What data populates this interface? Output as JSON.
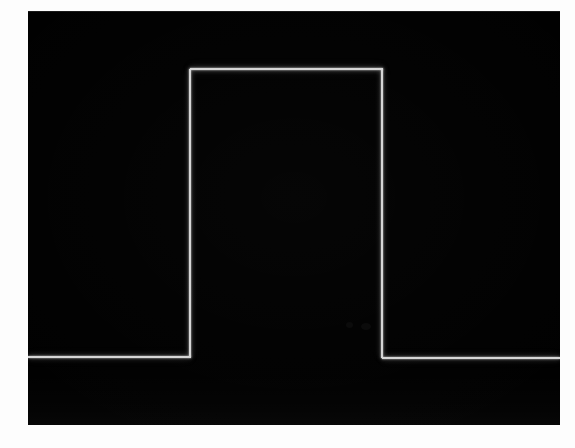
{
  "image": {
    "kind": "oscilloscope-screen-photograph",
    "width_px": 575,
    "height_px": 448,
    "paper_border_color": "#fdfdfd",
    "caption": "Oscilloscope screen showing a single rectangular pulse waveform"
  },
  "screen": {
    "name": "oscilloscope-display",
    "background_color": "#010101",
    "left_px": 28,
    "top_px": 11,
    "width_px": 532,
    "height_px": 414,
    "graticule_visible": false,
    "onscreen_text": "",
    "annotations": []
  },
  "trace": {
    "name": "pulse-trace",
    "color": "#d6d6d6",
    "line_width_px": 2,
    "glow": true,
    "segments": [
      {
        "id": "baseline-left",
        "type": "horizontal",
        "x1": 28,
        "x2": 191,
        "y": 357
      },
      {
        "id": "rising-edge",
        "type": "vertical",
        "x": 190,
        "y1": 357,
        "y2": 69
      },
      {
        "id": "pulse-top",
        "type": "horizontal",
        "x1": 190,
        "x2": 383,
        "y": 69
      },
      {
        "id": "falling-edge",
        "type": "vertical",
        "x": 382,
        "y1": 69,
        "y2": 358
      },
      {
        "id": "baseline-right",
        "type": "horizontal",
        "x1": 382,
        "x2": 560,
        "y": 358
      }
    ]
  },
  "chart_data": {
    "type": "line",
    "title": "Rectangular pulse waveform",
    "subtitle": "",
    "xlabel": "",
    "ylabel": "",
    "legend": [],
    "legend_position": "none",
    "grid": false,
    "xlim": [
      0,
      100
    ],
    "ylim": [
      0,
      100
    ],
    "series": [
      {
        "name": "pulse",
        "color": "#d6d6d6",
        "x": [
          0,
          30.5,
          30.5,
          66.5,
          66.5,
          100
        ],
        "y": [
          0,
          0,
          100,
          100,
          0,
          0
        ]
      }
    ],
    "notes": {
      "baseline_level": 0,
      "high_level": 100,
      "pulse_start_pct": 30.5,
      "pulse_end_pct": 66.5,
      "duty_cycle_pct": 36
    }
  }
}
